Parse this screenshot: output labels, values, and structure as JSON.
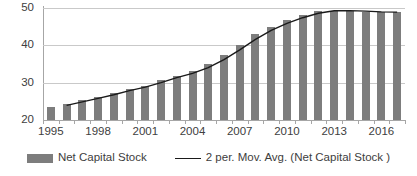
{
  "chart_data": {
    "type": "bar",
    "title": "",
    "subtitle": "",
    "xlabel": "",
    "ylabel": "",
    "ylim": [
      20,
      50
    ],
    "yticks": [
      20,
      30,
      40,
      50
    ],
    "ytick_labels": [
      "20",
      "30",
      "40",
      "50"
    ],
    "grid": true,
    "legend_position": "bottom",
    "categories": [
      "1995",
      "1996",
      "1997",
      "1998",
      "1999",
      "2000",
      "2001",
      "2002",
      "2003",
      "2004",
      "2005",
      "2006",
      "2007",
      "2008",
      "2009",
      "2010",
      "2011",
      "2012",
      "2013",
      "2014",
      "2015",
      "2016",
      "2017"
    ],
    "xtick_labels": [
      "1995",
      "1998",
      "2001",
      "2004",
      "2007",
      "2010",
      "2013",
      "2016"
    ],
    "series": [
      {
        "name": "Net Capital Stock",
        "type": "bar",
        "color": "#7d7d7d",
        "values": [
          23.5,
          24.3,
          25.4,
          26.2,
          27.3,
          28.4,
          29.2,
          30.8,
          31.9,
          33.1,
          35.0,
          37.4,
          40.2,
          43.0,
          45.0,
          46.8,
          48.0,
          49.2,
          49.3,
          49.3,
          49.0,
          48.9,
          48.9
        ]
      },
      {
        "name": "2 per. Mov. Avg. (Net Capital Stock )",
        "type": "line",
        "color": "#1a1a1a",
        "values": [
          null,
          23.9,
          24.85,
          25.8,
          26.75,
          27.85,
          28.8,
          30.0,
          31.35,
          32.5,
          34.05,
          36.2,
          38.8,
          41.6,
          44.0,
          45.9,
          47.4,
          48.6,
          49.25,
          49.3,
          49.15,
          48.95,
          48.9
        ]
      }
    ]
  },
  "legend": {
    "bar_label": "Net Capital Stock",
    "line_label": "2 per. Mov. Avg. (Net Capital Stock )"
  }
}
